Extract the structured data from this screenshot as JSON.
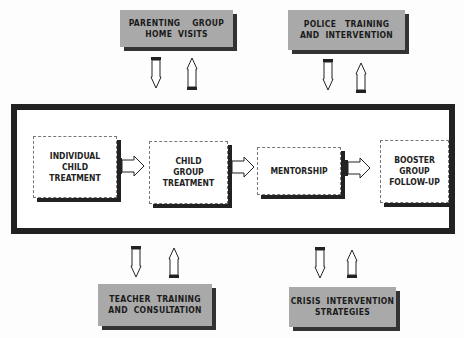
{
  "top_boxes": [
    {
      "lines": [
        "PARENTING    GROUP",
        "HOME  VISITS"
      ]
    },
    {
      "lines": [
        "POLICE   TRAINING",
        "AND  INTERVENTION"
      ]
    }
  ],
  "bottom_boxes": [
    {
      "lines": [
        "TEACHER  TRAINING",
        "AND  CONSULTATION"
      ]
    },
    {
      "lines": [
        "CRISIS  INTERVENTION",
        "STRATEGIES"
      ]
    }
  ],
  "process_steps": [
    {
      "lines": [
        "INDIVIDUAL",
        "CHILD",
        "TREATMENT"
      ]
    },
    {
      "lines": [
        "CHILD",
        "GROUP",
        "TREATMENT"
      ]
    },
    {
      "lines": [
        "MENTORSHIP"
      ]
    },
    {
      "lines": [
        "BOOSTER",
        "GROUP",
        "FOLLOW-UP"
      ]
    }
  ],
  "colors": {
    "gray_box": "#a9a9a9",
    "frame": "#222222",
    "shadow": "#333333"
  }
}
